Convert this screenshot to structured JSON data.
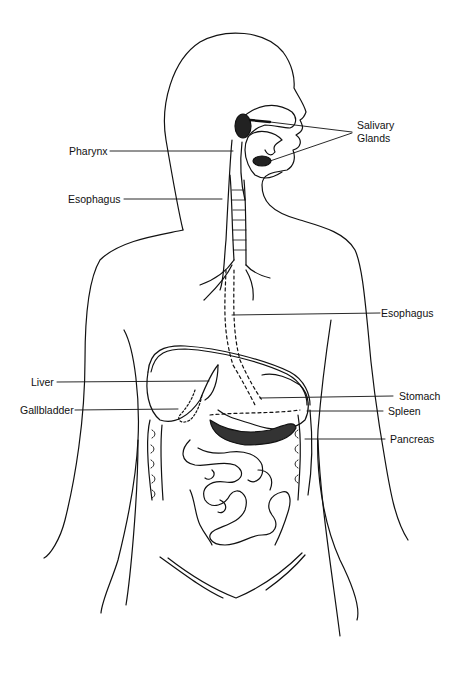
{
  "labels": {
    "salivary_glands_1": "Salivary",
    "salivary_glands_2": "Glands",
    "pharynx": "Pharynx",
    "esophagus_upper": "Esophagus",
    "esophagus_lower": "Esophagus",
    "liver": "Liver",
    "stomach": "Stomach",
    "gallbladder": "Gallbladder",
    "spleen": "Spleen",
    "pancreas": "Pancreas"
  },
  "colors": {
    "line": "#111111",
    "background": "#ffffff"
  }
}
